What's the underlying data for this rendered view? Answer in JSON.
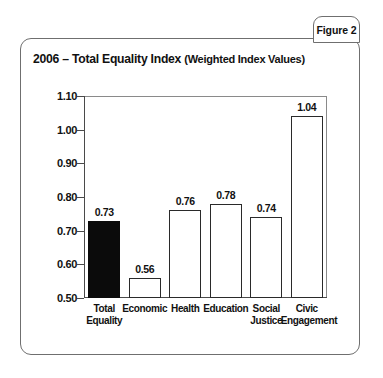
{
  "figure": {
    "tab_label": "Figure 2"
  },
  "chart_data": {
    "type": "bar",
    "title_year": "2006 – Total Equality Index ",
    "title_sub": "(Weighted Index Values)",
    "title": "2006 – Total Equality Index (Weighted Index Values)",
    "xlabel": "",
    "ylabel": "",
    "ylim": [
      0.5,
      1.1
    ],
    "ytick_step": 0.1,
    "grid": false,
    "legend": false,
    "ytick_labels": [
      "1.10",
      "1.00",
      "0.90",
      "0.80",
      "0.70",
      "0.60",
      "0.50"
    ],
    "ytick_values": [
      1.1,
      1.0,
      0.9,
      0.8,
      0.7,
      0.6,
      0.5
    ],
    "categories": [
      "Total Equality",
      "Economic",
      "Health",
      "Education",
      "Social Justice",
      "Civic Engagement"
    ],
    "category_lines": [
      [
        "Total",
        "Equality"
      ],
      [
        "Economic",
        ""
      ],
      [
        "Health",
        ""
      ],
      [
        "Education",
        ""
      ],
      [
        "Social",
        "Justice"
      ],
      [
        "Civic",
        "Engagement"
      ]
    ],
    "values": [
      0.73,
      0.56,
      0.76,
      0.78,
      0.74,
      1.04
    ],
    "value_labels": [
      "0.73",
      "0.56",
      "0.76",
      "0.78",
      "0.74",
      "1.04"
    ],
    "bar_styles": [
      "filled",
      "outline",
      "outline",
      "outline",
      "outline",
      "outline"
    ],
    "colors": {
      "bar_fill_highlight": "#0b0b0b",
      "bar_fill_default": "#ffffff",
      "bar_outline": "#2a2a2a",
      "axis": "#4a4a4a",
      "frame": "#6f6f6f",
      "text": "#111111",
      "background": "#ffffff"
    }
  }
}
